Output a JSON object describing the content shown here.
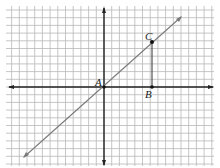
{
  "diagram": {
    "type": "coordinate-grid",
    "grid": {
      "origin_px": [
        104,
        87
      ],
      "cell_px": 7.7,
      "cols": 27,
      "rows": 21,
      "left_px": 6,
      "top_px": 6
    },
    "axes": {
      "x_arrows": true,
      "y_arrows": true
    },
    "line": {
      "description": "line through origin with slope 1",
      "from": [
        -11,
        -10
      ],
      "to": [
        10,
        9
      ]
    },
    "points": [
      {
        "name": "A",
        "label": "A",
        "x": 0,
        "y": 0
      },
      {
        "name": "B",
        "label": "B",
        "x": 6,
        "y": 0
      },
      {
        "name": "C",
        "label": "C",
        "x": 6,
        "y": 6
      }
    ],
    "segments": [
      {
        "from": "B",
        "to": "C"
      }
    ],
    "colors": {
      "grid": "#b8b8b8",
      "axis": "#222222",
      "line": "#7a7a7a",
      "segment": "#333333"
    }
  }
}
